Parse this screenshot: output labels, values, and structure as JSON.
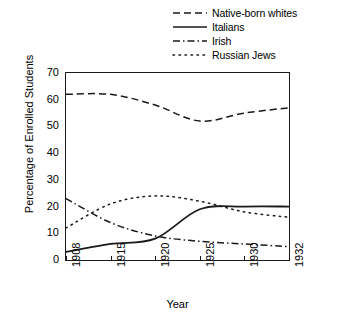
{
  "chart_data": {
    "type": "line",
    "title": "",
    "xlabel": "Year",
    "ylabel": "Percentage of Enrolled Students",
    "xlim": [
      1908,
      1932
    ],
    "ylim": [
      0,
      70
    ],
    "yticks": [
      0,
      10,
      20,
      30,
      40,
      50,
      60,
      70
    ],
    "xticks": [
      1908,
      1915,
      1920,
      1925,
      1930,
      1932
    ],
    "xtick_labels": [
      "1908",
      "1915",
      "1920",
      "1925",
      "1930",
      "1932"
    ],
    "ytick_labels": [
      "0",
      "10",
      "20",
      "30",
      "40",
      "50",
      "60",
      "70"
    ],
    "grid": false,
    "legend_position": "top-right",
    "x": [
      1908,
      1915,
      1920,
      1925,
      1930,
      1932
    ],
    "series": [
      {
        "name": "Native-born whites",
        "style": "dashed",
        "color": "#1a1a1a",
        "values": [
          62,
          62,
          58,
          52,
          55,
          57
        ]
      },
      {
        "name": "Italians",
        "style": "solid",
        "color": "#1a1a1a",
        "values": [
          3,
          6,
          8,
          19,
          20,
          20
        ]
      },
      {
        "name": "Irish",
        "style": "dash-dot",
        "color": "#1a1a1a",
        "values": [
          23,
          14,
          9,
          7,
          6,
          5
        ]
      },
      {
        "name": "Russian Jews",
        "style": "dotted",
        "color": "#1a1a1a",
        "values": [
          12,
          21,
          24,
          22,
          18,
          16
        ]
      }
    ]
  },
  "legend": {
    "items": [
      {
        "label": "Native-born whites",
        "style": "dashed"
      },
      {
        "label": "Italians",
        "style": "solid"
      },
      {
        "label": "Irish",
        "style": "dash-dot"
      },
      {
        "label": "Russian Jews",
        "style": "dotted"
      }
    ]
  },
  "colors": {
    "ink": "#1a1a1a",
    "background": "#ffffff"
  }
}
